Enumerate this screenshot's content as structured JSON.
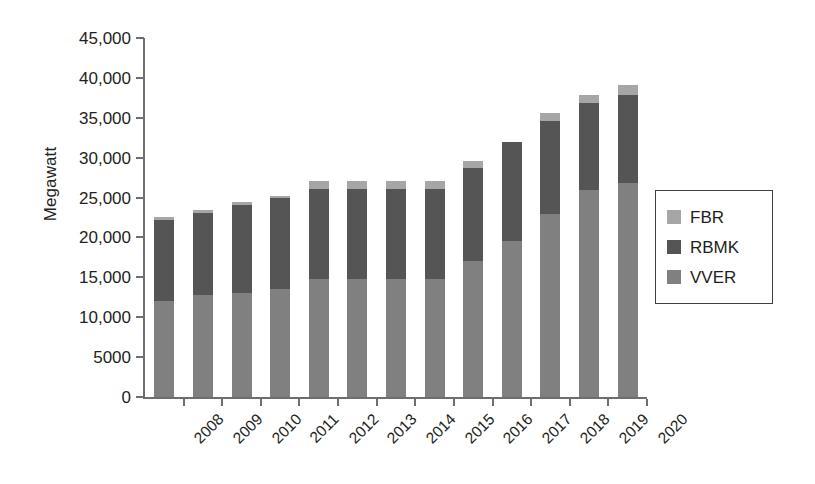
{
  "chart_data": {
    "type": "bar",
    "stacked": true,
    "title": "",
    "xlabel": "",
    "ylabel": "Megawatt",
    "ylim": [
      0,
      45000
    ],
    "ytick_step": 5000,
    "grid": false,
    "legend_position": "right",
    "categories": [
      "2008",
      "2009",
      "2010",
      "2011",
      "2012",
      "2013",
      "2014",
      "2015",
      "2016",
      "2017",
      "2018",
      "2019",
      "2020"
    ],
    "ytick_labels": [
      "45,000",
      "40,000",
      "35,000",
      "30,000",
      "25,000",
      "20,000",
      "15,000",
      "10,000",
      "5000",
      "0"
    ],
    "ytick_values": [
      45000,
      40000,
      35000,
      30000,
      25000,
      20000,
      15000,
      10000,
      5000,
      0
    ],
    "series": [
      {
        "name": "VVER",
        "color": "#808080",
        "values": [
          12000,
          12800,
          13000,
          13500,
          14800,
          14800,
          14800,
          14800,
          17000,
          19600,
          23000,
          25900,
          26800
        ]
      },
      {
        "name": "RBMK",
        "color": "#555555",
        "values": [
          10200,
          10300,
          11100,
          11400,
          11300,
          11300,
          11300,
          11300,
          11700,
          12400,
          11600,
          10900,
          11100
        ]
      },
      {
        "name": "FBR",
        "color": "#a6a6a6",
        "values": [
          400,
          300,
          300,
          300,
          1000,
          1000,
          1000,
          1000,
          900,
          0,
          1000,
          1100,
          1200
        ]
      }
    ],
    "totals": [
      22600,
      23400,
      24400,
      25200,
      27100,
      27100,
      27100,
      27100,
      29600,
      32000,
      35600,
      37900,
      39100
    ]
  },
  "legend": {
    "items": [
      {
        "label": "FBR",
        "color": "#a6a6a6"
      },
      {
        "label": "RBMK",
        "color": "#555555"
      },
      {
        "label": "VVER",
        "color": "#808080"
      }
    ]
  }
}
